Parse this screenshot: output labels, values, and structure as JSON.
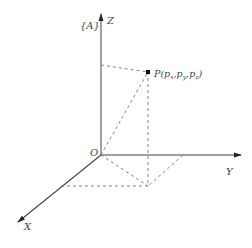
{
  "diagram": {
    "frame_label": "{A}",
    "axes": {
      "z_label": "Z",
      "y_label": "Y",
      "x_label": "X",
      "origin_label": "O"
    },
    "point": {
      "name": "P",
      "label": "P(p",
      "sub_x": "x",
      "sub_y": "y",
      "sub_z": "z",
      "comma": ",",
      "close": ")"
    },
    "colors": {
      "axis": "#333333",
      "dashed": "#777777",
      "text": "#444444"
    }
  }
}
